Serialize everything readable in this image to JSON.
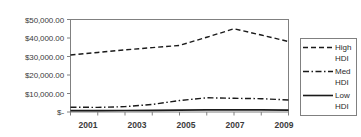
{
  "chart_data": {
    "type": "line",
    "title": "",
    "xlabel": "",
    "ylabel": "",
    "x": [
      2001,
      2002,
      2003,
      2004,
      2005,
      2006,
      2007,
      2008,
      2009
    ],
    "categories": [
      "2001",
      "2002",
      "2003",
      "2004",
      "2005",
      "2006",
      "2007",
      "2008",
      "2009"
    ],
    "xtick_labels": [
      "2001",
      "2003",
      "2005",
      "2007",
      "2009"
    ],
    "xtick_values": [
      2001,
      2003,
      2005,
      2007,
      2009
    ],
    "ytick_labels": [
      "$50,000.00",
      "$40,000.00",
      "$30,000.00",
      "$20,000.00",
      "$10,000.00",
      "$-"
    ],
    "ytick_values": [
      50000,
      40000,
      30000,
      20000,
      10000,
      0
    ],
    "ylim": [
      0,
      50000
    ],
    "xlim": [
      2001,
      2009
    ],
    "grid": false,
    "legend_position": "right",
    "series": [
      {
        "name": "High HDI",
        "label_line1": "High",
        "label_line2": "HDI",
        "style": "dashed",
        "color": "#1a1a1a",
        "values": [
          30800,
          32200,
          33600,
          34800,
          36000,
          40400,
          45000,
          41600,
          38100
        ]
      },
      {
        "name": "Med HDI",
        "label_line1": "Med",
        "label_line2": "HDI",
        "style": "dash-dot",
        "color": "#1a1a1a",
        "values": [
          2600,
          2500,
          2900,
          4100,
          6200,
          7700,
          7400,
          7200,
          6500
        ]
      },
      {
        "name": "Low HDI",
        "label_line1": "Low",
        "label_line2": "HDI",
        "style": "solid",
        "color": "#1a1a1a",
        "values": [
          700,
          750,
          800,
          900,
          1000,
          1100,
          1150,
          1100,
          1000
        ]
      }
    ]
  },
  "axis": {
    "y_ticks": [
      {
        "label": "$50,000.00",
        "value": 50000
      },
      {
        "label": "$40,000.00",
        "value": 40000
      },
      {
        "label": "$30,000.00",
        "value": 30000
      },
      {
        "label": "$20,000.00",
        "value": 20000
      },
      {
        "label": "$10,000.00",
        "value": 10000
      },
      {
        "label": "$-",
        "value": 0
      }
    ],
    "x_ticks": [
      {
        "label": "2001",
        "value": 2001
      },
      {
        "label": "2003",
        "value": 2003
      },
      {
        "label": "2005",
        "value": 2005
      },
      {
        "label": "2007",
        "value": 2007
      },
      {
        "label": "2009",
        "value": 2009
      }
    ]
  },
  "colors": {
    "axis": "#808080",
    "line": "#1a1a1a",
    "text": "#3b3b3b",
    "background": "#ffffff"
  }
}
